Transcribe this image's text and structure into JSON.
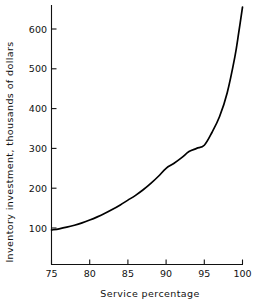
{
  "chart_data": {
    "type": "line",
    "title": "",
    "xlabel": "Service percentage",
    "ylabel": "Inventory investment, thousands of dollars",
    "xlim": [
      75,
      100
    ],
    "ylim": [
      0,
      655
    ],
    "grid": false,
    "legend": "none",
    "xticks": [
      75,
      80,
      85,
      90,
      95,
      100
    ],
    "xtick_labels": [
      "75",
      "80",
      "85",
      "90",
      "95",
      "100"
    ],
    "yticks": [
      100,
      200,
      300,
      400,
      500,
      600
    ],
    "ytick_labels": [
      "100",
      "200",
      "300",
      "400",
      "500",
      "600"
    ],
    "line_color": "#000000",
    "series": [
      {
        "name": "Inventory investment",
        "x": [
          75,
          76,
          77,
          78,
          79,
          80,
          81,
          82,
          83,
          84,
          85,
          86,
          87,
          88,
          89,
          90,
          91,
          92,
          93,
          94,
          95,
          96,
          97,
          98,
          99,
          99.5,
          100
        ],
        "y": [
          95,
          98,
          102,
          107,
          113,
          120,
          128,
          137,
          147,
          158,
          170,
          182,
          196,
          212,
          230,
          250,
          262,
          276,
          292,
          300,
          308,
          340,
          380,
          440,
          530,
          590,
          655
        ]
      }
    ]
  },
  "axis": {
    "x_title": "Service percentage",
    "y_title": "Inventory investment, thousands of dollars"
  }
}
